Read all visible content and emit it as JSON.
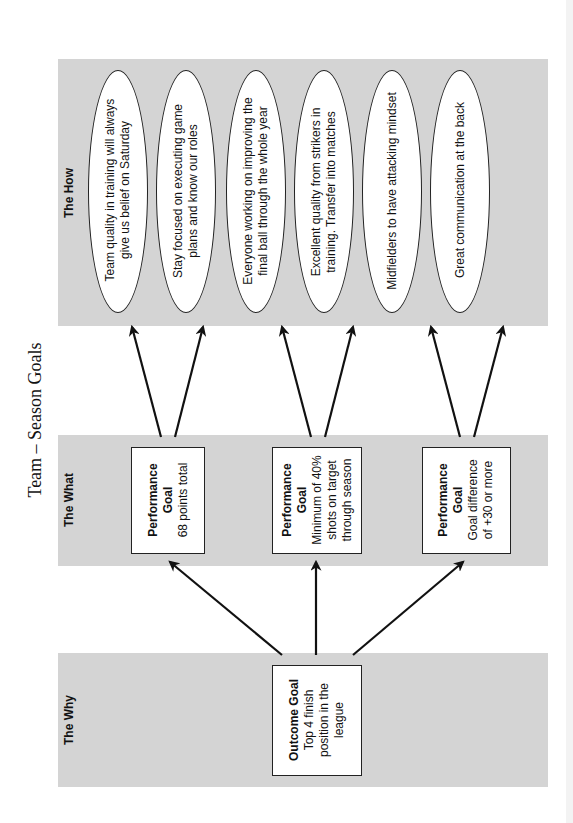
{
  "title": "Team – Season Goals",
  "panels": {
    "how": {
      "label": "The How"
    },
    "what": {
      "label": "The What"
    },
    "why": {
      "label": "The Why"
    }
  },
  "how_items": [
    {
      "line1": "Team quality in training will always",
      "line2": "give us belief on Saturday"
    },
    {
      "line1": "Stay focused on executing game",
      "line2": "plans and know our roles"
    },
    {
      "line1": "Everyone working on improving the",
      "line2": "final ball through the whole year"
    },
    {
      "line1": "Excellent quality from strikers in",
      "line2": "training. Transfer into matches"
    },
    {
      "line1": "Midfielders to have attacking mindset",
      "line2": ""
    },
    {
      "line1": "Great communication at the back",
      "line2": ""
    }
  ],
  "what_items": [
    {
      "heading1": "Performance",
      "heading2": "Goal",
      "line1": "68 points total",
      "line2": "",
      "line3": ""
    },
    {
      "heading1": "Performance",
      "heading2": "Goal",
      "line1": "Minimum of 40%",
      "line2": "shots on target",
      "line3": "through season"
    },
    {
      "heading1": "Performance",
      "heading2": "Goal",
      "line1": "Goal difference",
      "line2": "of +30 or more",
      "line3": ""
    }
  ],
  "why_item": {
    "heading": "Outcome Goal",
    "line1": "Top 4 finish",
    "line2": "position in the",
    "line3": "league"
  },
  "colors": {
    "panel_bg": "#d4d4d4",
    "stroke": "#111111",
    "node_bg": "#ffffff"
  }
}
